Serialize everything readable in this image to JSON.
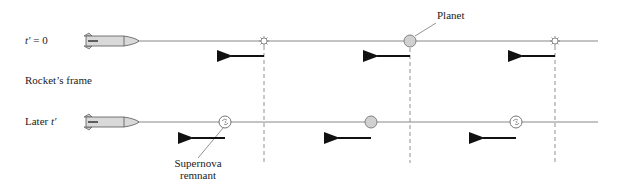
{
  "labels": {
    "t0": "t′ = 0",
    "t0_var": "t′",
    "t0_eq": " = 0",
    "frame": "Rocket’s frame",
    "later": "Later ",
    "later_var": "t′",
    "planet": "Planet",
    "remnant_line1": "Supernova",
    "remnant_line2": "remnant"
  },
  "rows": [
    {
      "name": "t-prime-zero",
      "objects": [
        "star",
        "planet",
        "star"
      ],
      "arrows": 3
    },
    {
      "name": "later-t-prime",
      "objects": [
        "supernova-remnant",
        "planet",
        "supernova-remnant"
      ],
      "arrows": 3
    }
  ],
  "colors": {
    "line": "#888888",
    "planet_fill": "#d0d0d0",
    "rocket_fill": "#d9d9d9",
    "arrow": "#111111"
  }
}
